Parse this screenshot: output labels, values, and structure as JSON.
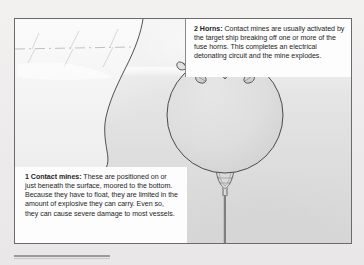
{
  "figure": {
    "background_color": "#dcdcdc",
    "border_color": "#6b6b6b"
  },
  "captions": [
    {
      "number": "1",
      "heading": "Contact mines:",
      "body": "These are positioned on or just beneath the surface, moored to the bottom. Because they have to float, they are limited in the amount of explosive they can carry. Even so, they can cause severe damage to most vessels."
    },
    {
      "number": "2",
      "heading": "Horns:",
      "body": "Contact mines are usually activated by the target ship breaking off one or more of the fuse horns. This completes an electrical detonating circuit and the mine explodes."
    }
  ],
  "illustration": {
    "elements": [
      {
        "name": "ship-hull",
        "label": "Ship hull"
      },
      {
        "name": "waterline",
        "label": "Water surface"
      },
      {
        "name": "mine-sphere",
        "label": "Spherical contact mine"
      },
      {
        "name": "horn-left",
        "label": "Fuse horn (left)"
      },
      {
        "name": "horn-center",
        "label": "Fuse horn (centre)"
      },
      {
        "name": "horn-right",
        "label": "Fuse horn (right)"
      },
      {
        "name": "mooring-shackle",
        "label": "Mooring shackle"
      },
      {
        "name": "mooring-cable",
        "label": "Mooring cable to seabed"
      }
    ],
    "line_color": "#4a4a4a",
    "mine_fill": "#dedede"
  }
}
